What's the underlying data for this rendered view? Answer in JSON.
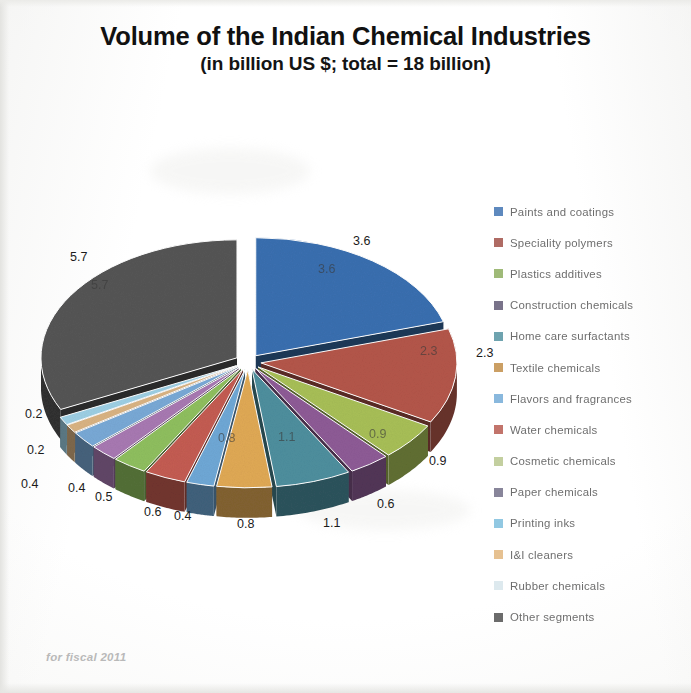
{
  "title": {
    "line1": "Volume of the Indian Chemical Industries",
    "line2": "(in billion US $; total = 18 billion)"
  },
  "footnote": "for fiscal 2011",
  "legend": {
    "position": "right",
    "items": [
      {
        "label": "Paints and coatings",
        "color": "#3a6fb0"
      },
      {
        "label": "Speciality polymers",
        "color": "#9e4b42"
      },
      {
        "label": "Plastics additives",
        "color": "#8aab5a"
      },
      {
        "label": "Construction chemicals",
        "color": "#5b5470"
      },
      {
        "label": "Home care surfactants",
        "color": "#4e8f9e"
      },
      {
        "label": "Textile chemicals",
        "color": "#c08a42"
      },
      {
        "label": "Flavors and fragrances",
        "color": "#6fa8d6"
      },
      {
        "label": "Water chemicals",
        "color": "#b4564a"
      },
      {
        "label": "Cosmetic chemicals",
        "color": "#b6c48a"
      },
      {
        "label": "Paper chemicals",
        "color": "#6e6a84"
      },
      {
        "label": "Printing inks",
        "color": "#79bcdc"
      },
      {
        "label": "I&I cleaners",
        "color": "#e0b379"
      },
      {
        "label": "Rubber chemicals",
        "color": "#d6e4ea"
      },
      {
        "label": "Other segments",
        "color": "#4a4a4a"
      }
    ]
  },
  "chart_data": {
    "type": "pie",
    "title": "Volume of the Indian Chemical Industries",
    "subtitle": "(in billion US $; total = 18 billion)",
    "unit": "billion US $",
    "total": 18,
    "exploded": true,
    "three_d": true,
    "legend_position": "right",
    "grid": false,
    "categories": [
      "Paints and coatings",
      "Speciality polymers",
      "Plastics additives",
      "Construction chemicals",
      "Home care surfactants",
      "Textile chemicals",
      "Flavors and fragrances",
      "Water chemicals",
      "Cosmetic chemicals",
      "Paper chemicals",
      "Printing inks",
      "I&I cleaners",
      "Rubber chemicals",
      "Other segments"
    ],
    "values": [
      3.6,
      2.3,
      0.9,
      0.6,
      1.1,
      0.8,
      0.4,
      0.6,
      0.5,
      0.4,
      0.4,
      0.2,
      0.2,
      5.7
    ],
    "labels": [
      "3.6",
      "2.3",
      "0.9",
      "0.6",
      "1.1",
      "0.8",
      "0.4",
      "0.6",
      "0.5",
      "0.4",
      "0.4",
      "0.2",
      "0.2",
      "5.7"
    ],
    "colors": [
      "#3a6fb0",
      "#b4564a",
      "#a8bf57",
      "#8e5b96",
      "#4e8f9e",
      "#e0a955",
      "#6fa8d6",
      "#c45c52",
      "#8fbf5f",
      "#a879b2",
      "#79a9d6",
      "#d9b383",
      "#9dcfe4",
      "#555555"
    ]
  },
  "data_labels": {
    "outer": [
      {
        "text": "3.6",
        "x": 345,
        "y": 84,
        "name": "label-paints-and-coatings"
      },
      {
        "text": "2.3",
        "x": 468,
        "y": 196,
        "name": "label-speciality-polymers"
      },
      {
        "text": "0.9",
        "x": 421,
        "y": 304,
        "name": "label-plastics-additives"
      },
      {
        "text": "0.6",
        "x": 369,
        "y": 347,
        "name": "label-construction-chemicals"
      },
      {
        "text": "1.1",
        "x": 315,
        "y": 366,
        "name": "label-home-care-surfactants"
      },
      {
        "text": "0.8",
        "x": 229,
        "y": 367,
        "name": "label-textile-chemicals"
      },
      {
        "text": "0.4",
        "x": 166,
        "y": 359,
        "name": "label-flavors-and-fragrances"
      },
      {
        "text": "0.6",
        "x": 136,
        "y": 355,
        "name": "label-water-chemicals"
      },
      {
        "text": "0.5",
        "x": 87,
        "y": 340,
        "name": "label-cosmetic-chemicals"
      },
      {
        "text": "0.4",
        "x": 60,
        "y": 331,
        "name": "label-paper-chemicals"
      },
      {
        "text": "0.4",
        "x": 13,
        "y": 327,
        "name": "label-printing-inks"
      },
      {
        "text": "0.2",
        "x": 19,
        "y": 293,
        "name": "label-ii-cleaners"
      },
      {
        "text": "0.2",
        "x": 17,
        "y": 257,
        "name": "label-rubber-chemicals"
      },
      {
        "text": "5.7",
        "x": 62,
        "y": 100,
        "name": "label-other-segments"
      }
    ],
    "inner": [
      {
        "text": "3.6",
        "x": 310,
        "y": 112,
        "name": "inner-label-paints-and-coatings"
      },
      {
        "text": "2.3",
        "x": 412,
        "y": 194,
        "name": "inner-label-speciality-polymers"
      },
      {
        "text": "0.9",
        "x": 361,
        "y": 277,
        "name": "inner-label-plastics-additives"
      },
      {
        "text": "1.1",
        "x": 270,
        "y": 280,
        "name": "inner-label-home-care-surfactants"
      },
      {
        "text": "0.8",
        "x": 210,
        "y": 281,
        "name": "inner-label-textile-chemicals"
      },
      {
        "text": "5.7",
        "x": 83,
        "y": 128,
        "name": "inner-label-other-segments"
      }
    ]
  }
}
